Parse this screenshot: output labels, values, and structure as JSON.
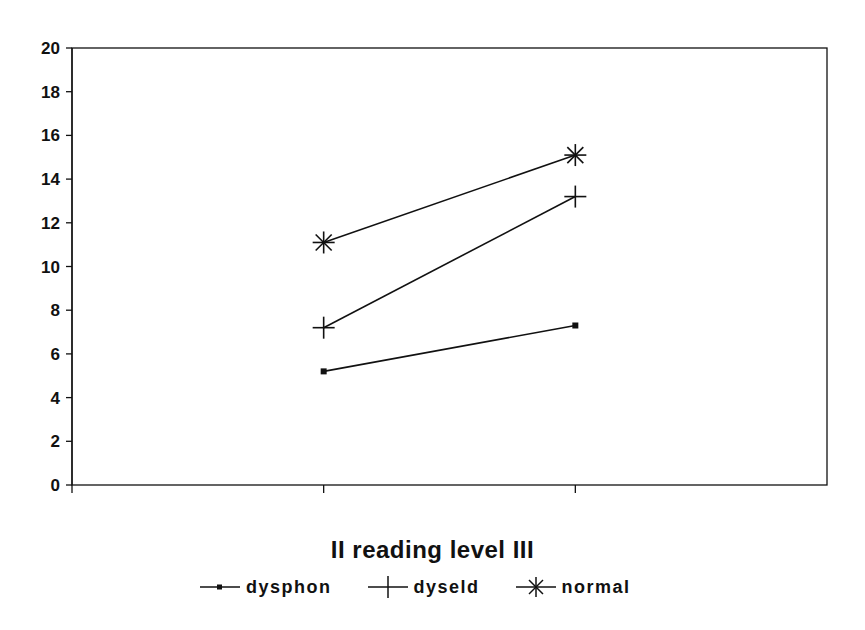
{
  "chart_data": {
    "type": "line",
    "title": "",
    "xlabel": "II reading level III",
    "ylabel": "",
    "categories": [
      "II",
      "III"
    ],
    "ylim": [
      0,
      20
    ],
    "yticks": [
      0,
      2,
      4,
      6,
      8,
      10,
      12,
      14,
      16,
      18,
      20
    ],
    "grid": false,
    "legend_position": "bottom",
    "series": [
      {
        "name": "dysphon",
        "marker": "square",
        "values": [
          5.2,
          7.3
        ]
      },
      {
        "name": "dyseld",
        "marker": "plus",
        "values": [
          7.2,
          13.2
        ]
      },
      {
        "name": "normal",
        "marker": "asterisk",
        "values": [
          11.1,
          15.1
        ]
      }
    ]
  },
  "legend": {
    "items": [
      {
        "label": "dysphon",
        "marker": "square-marker-icon"
      },
      {
        "label": "dyseld",
        "marker": "plus-marker-icon"
      },
      {
        "label": "normal",
        "marker": "asterisk-marker-icon"
      }
    ]
  },
  "colors": {
    "ink": "#111111",
    "background": "#ffffff"
  }
}
